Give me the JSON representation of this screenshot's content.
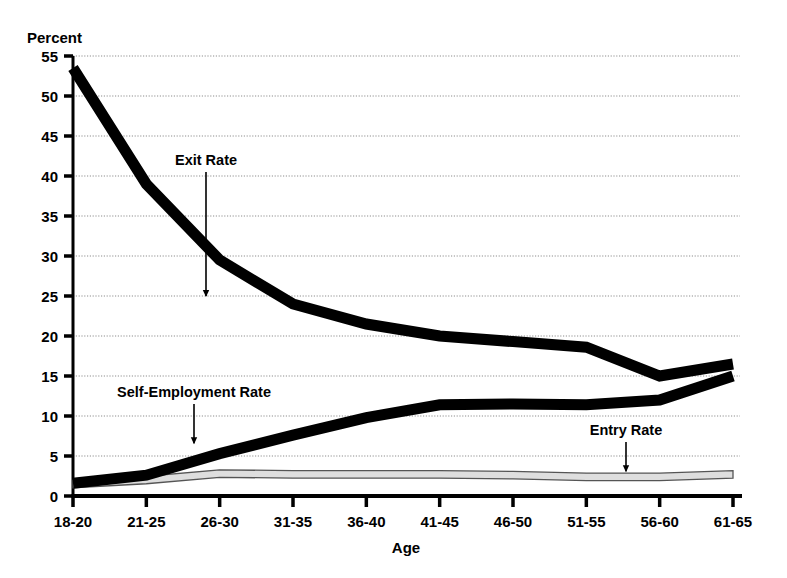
{
  "chart_data": {
    "type": "line",
    "title": "",
    "xlabel": "Age",
    "ylabel": "Percent",
    "ylim": [
      0,
      55
    ],
    "ytick_step": 5,
    "grid": true,
    "legend_position": "inline-annotations",
    "categories": [
      "18-20",
      "21-25",
      "26-30",
      "31-35",
      "36-40",
      "41-45",
      "46-50",
      "51-55",
      "56-60",
      "61-65"
    ],
    "yticks": [
      "0",
      "5",
      "10",
      "15",
      "20",
      "25",
      "30",
      "35",
      "40",
      "45",
      "50",
      "55"
    ],
    "series": [
      {
        "name": "Exit Rate",
        "color": "#000000",
        "style": "thick-black-band",
        "values": [
          53.5,
          39.0,
          29.5,
          24.0,
          21.5,
          20.0,
          19.3,
          18.6,
          15.0,
          16.5
        ]
      },
      {
        "name": "Self-Employment Rate",
        "color": "#000000",
        "style": "thick-black-band",
        "values": [
          1.6,
          2.6,
          5.3,
          7.6,
          9.8,
          11.4,
          11.5,
          11.4,
          12.0,
          15.0
        ]
      },
      {
        "name": "Entry Rate",
        "color": "#d9d9d9",
        "style": "light-gray-band",
        "values": [
          1.5,
          2.0,
          2.8,
          2.7,
          2.7,
          2.7,
          2.6,
          2.4,
          2.4,
          2.7
        ]
      }
    ],
    "annotations": [
      {
        "label": "Exit Rate",
        "target_category": "31-35",
        "target_value": 25.0
      },
      {
        "label": "Self-Employment Rate",
        "target_category": "26-30",
        "target_value": 6.2
      },
      {
        "label": "Entry Rate",
        "target_category": "56-60",
        "target_value": 2.4
      }
    ]
  },
  "axes": {
    "y_unit_label": "Percent",
    "x_axis_title": "Age"
  },
  "labels": {
    "exit_rate": "Exit Rate",
    "self_employment_rate": "Self-Employment Rate",
    "entry_rate": "Entry Rate"
  },
  "colors": {
    "line_black": "#000000",
    "entry_band_fill": "#dedede",
    "entry_band_stroke": "#555555",
    "grid": "#b4b4b4",
    "axis": "#000000",
    "background": "#ffffff"
  }
}
